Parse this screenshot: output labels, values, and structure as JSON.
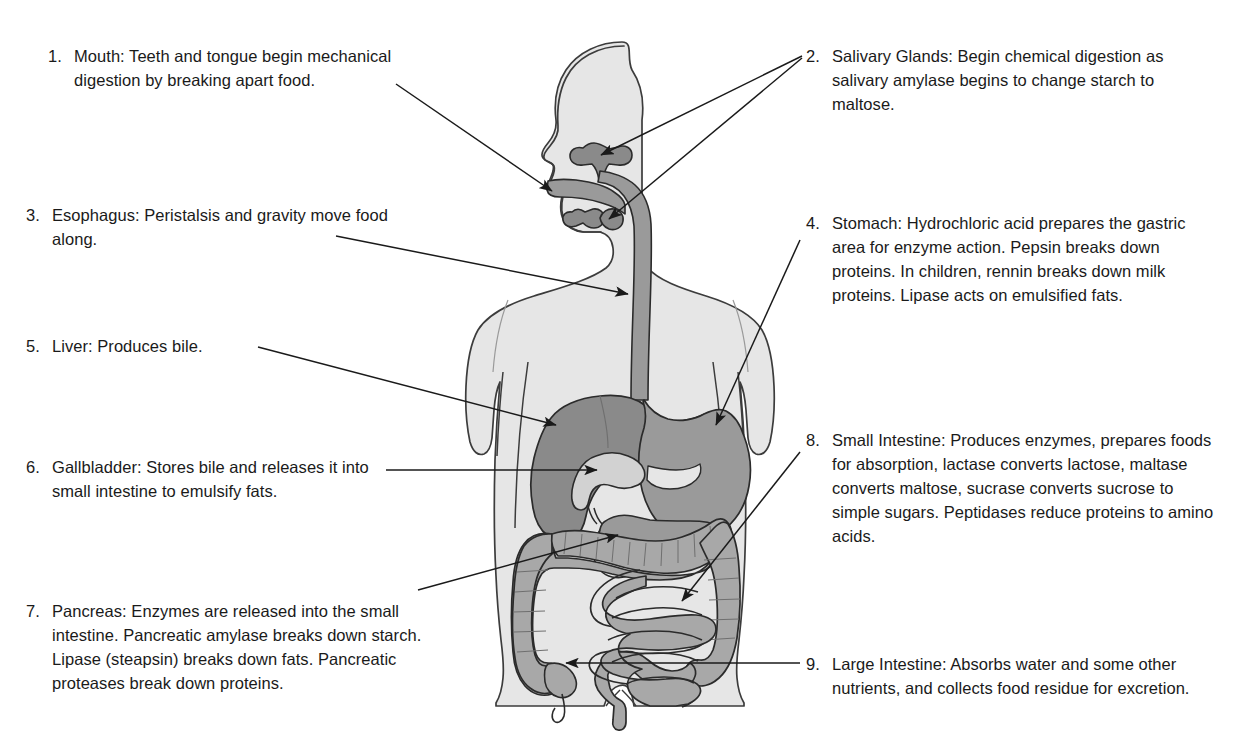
{
  "diagram": {
    "colors": {
      "body_fill": "#e6e6e6",
      "body_stroke": "#3c3c3c",
      "liver_fill": "#8a8a8a",
      "stomach_fill": "#9a9a9a",
      "esophagus_fill": "#9a9a9a",
      "intestine_fill": "#a8a8a8",
      "gallbladder_fill": "#d2d2d2",
      "pancreas_fill": "#9a9a9a",
      "organ_stroke": "#2b2b2b",
      "leader_line": "#1a1a1a",
      "text": "#1a1a1a"
    }
  },
  "labels": {
    "left": [
      {
        "number": "1.",
        "text": "Mouth: Teeth and tongue begin mechanical digestion by breaking apart food.",
        "organ": "mouth"
      },
      {
        "number": "3.",
        "text": "Esophagus: Peristalsis and gravity move food along.",
        "organ": "esophagus"
      },
      {
        "number": "5.",
        "text": "Liver: Produces bile.",
        "organ": "liver"
      },
      {
        "number": "6.",
        "text": "Gallbladder: Stores bile and releases it into small intestine to emulsify fats.",
        "organ": "gallbladder"
      },
      {
        "number": "7.",
        "text": "Pancreas: Enzymes are released into the small intestine. Pancreatic amylase breaks down starch. Lipase (steapsin) breaks down fats. Pancreatic proteases break down proteins.",
        "organ": "pancreas"
      }
    ],
    "right": [
      {
        "number": "2.",
        "text": "Salivary Glands: Begin chemical digestion as salivary amylase begins to change starch to maltose.",
        "organ": "salivary-glands"
      },
      {
        "number": "4.",
        "text": "Stomach: Hydrochloric acid prepares the gastric area for enzyme action. Pepsin breaks down proteins. In children, rennin breaks down milk proteins. Lipase acts on emulsified fats.",
        "organ": "stomach"
      },
      {
        "number": "8.",
        "text": "Small Intestine: Produces enzymes, prepares foods for absorption, lactase converts lactose, maltase converts maltose, sucrase converts sucrose to simple sugars. Peptidases reduce proteins to amino acids.",
        "organ": "small-intestine"
      },
      {
        "number": "9.",
        "text": "Large Intestine: Absorbs water and some other nutrients, and collects food residue for excretion.",
        "organ": "large-intestine"
      }
    ]
  }
}
